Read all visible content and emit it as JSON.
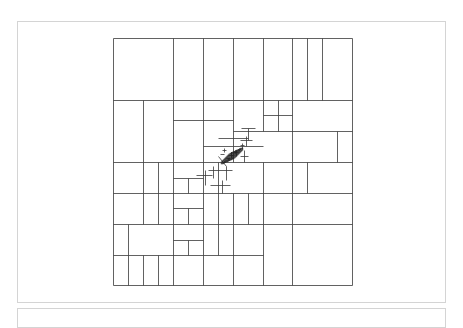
{
  "figure": {
    "type": "spatial-partition-tree",
    "stroke_color": "#3a3a3a",
    "bounds": {
      "x0": 113,
      "y0": 38,
      "x1": 352,
      "y1": 285
    },
    "segments": [
      [
        113,
        38,
        352,
        38
      ],
      [
        113,
        285,
        352,
        285
      ],
      [
        113,
        38,
        113,
        285
      ],
      [
        352,
        38,
        352,
        285
      ],
      [
        173,
        38,
        173,
        100
      ],
      [
        203,
        38,
        203,
        100
      ],
      [
        233,
        38,
        233,
        100
      ],
      [
        263,
        38,
        263,
        100
      ],
      [
        292,
        38,
        292,
        100
      ],
      [
        307,
        38,
        307,
        100
      ],
      [
        322,
        38,
        322,
        100
      ],
      [
        113,
        100,
        352,
        100
      ],
      [
        143,
        100,
        143,
        162
      ],
      [
        173,
        100,
        173,
        162
      ],
      [
        203,
        100,
        203,
        162
      ],
      [
        233,
        100,
        233,
        162
      ],
      [
        263,
        100,
        263,
        131
      ],
      [
        278,
        100,
        278,
        131
      ],
      [
        292,
        100,
        292,
        162
      ],
      [
        337,
        131,
        337,
        162
      ],
      [
        233,
        131,
        352,
        131
      ],
      [
        263,
        115,
        292,
        115
      ],
      [
        173,
        120,
        203,
        120
      ],
      [
        203,
        120,
        233,
        120
      ],
      [
        113,
        162,
        352,
        162
      ],
      [
        143,
        162,
        143,
        193
      ],
      [
        158,
        162,
        158,
        193
      ],
      [
        173,
        162,
        173,
        224
      ],
      [
        203,
        162,
        203,
        255
      ],
      [
        218,
        162,
        218,
        255
      ],
      [
        263,
        162,
        263,
        224
      ],
      [
        292,
        162,
        292,
        224
      ],
      [
        307,
        162,
        307,
        193
      ],
      [
        203,
        146,
        233,
        146
      ],
      [
        233,
        146,
        263,
        146
      ],
      [
        218,
        138,
        248,
        138
      ],
      [
        113,
        193,
        352,
        193
      ],
      [
        128,
        224,
        128,
        255
      ],
      [
        143,
        193,
        143,
        224
      ],
      [
        158,
        193,
        158,
        224
      ],
      [
        173,
        224,
        173,
        285
      ],
      [
        233,
        193,
        233,
        224
      ],
      [
        248,
        193,
        248,
        224
      ],
      [
        233,
        224,
        233,
        285
      ],
      [
        263,
        224,
        263,
        285
      ],
      [
        292,
        224,
        292,
        285
      ],
      [
        173,
        178,
        203,
        178
      ],
      [
        188,
        178,
        188,
        193
      ],
      [
        113,
        224,
        352,
        224
      ],
      [
        173,
        208,
        203,
        208
      ],
      [
        188,
        208,
        188,
        224
      ],
      [
        173,
        240,
        203,
        240
      ],
      [
        188,
        240,
        188,
        255
      ],
      [
        158,
        255,
        158,
        285
      ],
      [
        143,
        255,
        143,
        285
      ],
      [
        128,
        255,
        128,
        285
      ],
      [
        203,
        255,
        203,
        285
      ],
      [
        113,
        255,
        263,
        255
      ],
      [
        222,
        150,
        226,
        150
      ],
      [
        224,
        148,
        224,
        152
      ],
      [
        228,
        155,
        234,
        155
      ],
      [
        231,
        152,
        231,
        158
      ],
      [
        226,
        158,
        230,
        158
      ],
      [
        234,
        152,
        238,
        152
      ],
      [
        236,
        150,
        236,
        156
      ],
      [
        220,
        154,
        224,
        154
      ],
      [
        218,
        156,
        226,
        166
      ],
      [
        240,
        145,
        244,
        145
      ],
      [
        242,
        143,
        242,
        149
      ],
      [
        208,
        170,
        232,
        170
      ],
      [
        213,
        166,
        213,
        178
      ],
      [
        226,
        166,
        226,
        180
      ],
      [
        240,
        156,
        248,
        156
      ],
      [
        244,
        150,
        244,
        162
      ],
      [
        196,
        175,
        212,
        175
      ],
      [
        205,
        170,
        205,
        185
      ],
      [
        240,
        140,
        252,
        140
      ],
      [
        246,
        136,
        246,
        146
      ],
      [
        210,
        185,
        230,
        185
      ],
      [
        222,
        180,
        222,
        193
      ],
      [
        248,
        128,
        248,
        140
      ],
      [
        241,
        128,
        255,
        128
      ]
    ],
    "dense_cluster": {
      "cx": 232,
      "cy": 156,
      "rx": 12,
      "ry": 5,
      "rotate": -35,
      "color": "#222222",
      "count": 18
    }
  }
}
